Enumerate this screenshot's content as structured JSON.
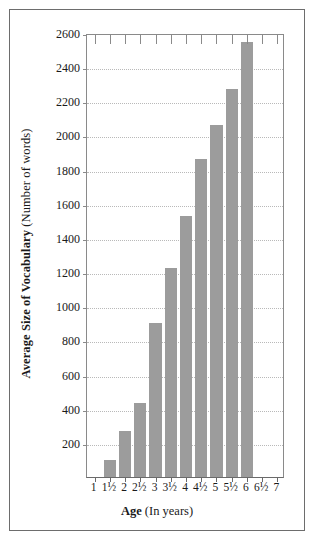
{
  "chart_data": {
    "type": "bar",
    "title": "",
    "xlabel_bold": "Age",
    "xlabel_rest": " (In years)",
    "ylabel_bold": "Average Size of Vocabulary",
    "ylabel_rest": " (Number of words)",
    "categories": [
      "1",
      "1½",
      "2",
      "2½",
      "3",
      "3½",
      "4",
      "4½",
      "5",
      "5½",
      "6",
      "6½",
      "7"
    ],
    "values": [
      0,
      100,
      270,
      435,
      900,
      1225,
      1530,
      1860,
      2060,
      2275,
      2550,
      0,
      0
    ],
    "ytick_labels": [
      "200",
      "400",
      "600",
      "800",
      "1000",
      "1200",
      "1400",
      "1600",
      "1800",
      "2000",
      "2200",
      "2400",
      "2600"
    ],
    "yticks": [
      200,
      400,
      600,
      800,
      1000,
      1200,
      1400,
      1600,
      1800,
      2000,
      2200,
      2400,
      2600
    ],
    "ylim": [
      0,
      2600
    ],
    "grid": true,
    "legend": "none",
    "bar_color": "#9c9c9c",
    "grid_color": "#b9b9b9",
    "axis_color": "#8a8a8a",
    "frame_color": "#6d6d6d",
    "text_color": "#1a1a1a"
  }
}
